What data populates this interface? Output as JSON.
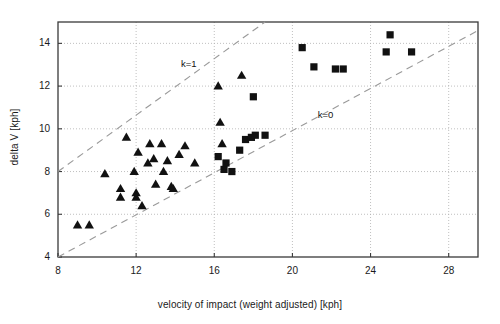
{
  "chart_data": {
    "type": "scatter",
    "title": "",
    "xlabel": "velocity of impact (weight adjusted) [kph]",
    "ylabel": "delta V [kph]",
    "xlim": [
      8,
      29.5
    ],
    "ylim": [
      4,
      15.0
    ],
    "xticks": [
      8,
      12,
      16,
      20,
      24,
      28
    ],
    "xticklabels": [
      "8",
      "12",
      "16",
      "20",
      "24",
      "28"
    ],
    "yticks": [
      4,
      6,
      8,
      10,
      12,
      14
    ],
    "yticklabels": [
      "4",
      "6",
      "8",
      "10",
      "12",
      "14"
    ],
    "grid": true,
    "grid_style": "dotted",
    "legend": "none",
    "marker_color": "#111111",
    "series": [
      {
        "name": "triangles",
        "marker": "triangle",
        "points": [
          [
            9.0,
            5.5
          ],
          [
            9.6,
            5.5
          ],
          [
            10.4,
            7.9
          ],
          [
            11.2,
            7.2
          ],
          [
            11.2,
            6.8
          ],
          [
            11.5,
            9.6
          ],
          [
            11.9,
            8.0
          ],
          [
            12.0,
            7.0
          ],
          [
            12.0,
            6.8
          ],
          [
            12.1,
            8.9
          ],
          [
            12.3,
            6.4
          ],
          [
            12.6,
            8.4
          ],
          [
            12.7,
            9.3
          ],
          [
            12.9,
            8.6
          ],
          [
            13.0,
            7.4
          ],
          [
            13.3,
            9.3
          ],
          [
            13.4,
            8.0
          ],
          [
            13.6,
            8.5
          ],
          [
            13.8,
            7.3
          ],
          [
            13.9,
            7.2
          ],
          [
            14.2,
            8.8
          ],
          [
            14.5,
            9.2
          ],
          [
            15.0,
            8.4
          ],
          [
            16.2,
            12.0
          ],
          [
            16.3,
            10.3
          ],
          [
            16.4,
            9.3
          ],
          [
            17.4,
            12.5
          ]
        ]
      },
      {
        "name": "squares",
        "marker": "square",
        "points": [
          [
            16.2,
            8.7
          ],
          [
            16.5,
            8.1
          ],
          [
            16.6,
            8.4
          ],
          [
            16.9,
            8.0
          ],
          [
            17.3,
            9.0
          ],
          [
            17.6,
            9.5
          ],
          [
            17.9,
            9.6
          ],
          [
            18.1,
            9.7
          ],
          [
            18.0,
            11.5
          ],
          [
            18.6,
            9.7
          ],
          [
            20.5,
            13.8
          ],
          [
            21.1,
            12.9
          ],
          [
            22.2,
            12.8
          ],
          [
            22.6,
            12.8
          ],
          [
            24.8,
            13.6
          ],
          [
            25.0,
            14.4
          ],
          [
            26.1,
            13.6
          ]
        ]
      }
    ],
    "annotations": [
      {
        "text": "k=1",
        "x": 14.3,
        "y": 13.0
      },
      {
        "text": "k=0",
        "x": 21.3,
        "y": 10.6
      }
    ],
    "reference_lines": [
      {
        "name": "k=1",
        "x0": 8.0,
        "y0": 8.0,
        "x1": 18.6,
        "y1": 15.0,
        "style": "dashed"
      },
      {
        "name": "k=0",
        "x0": 8.0,
        "y0": 4.0,
        "x1": 29.5,
        "y1": 14.6,
        "style": "dashed"
      }
    ]
  }
}
